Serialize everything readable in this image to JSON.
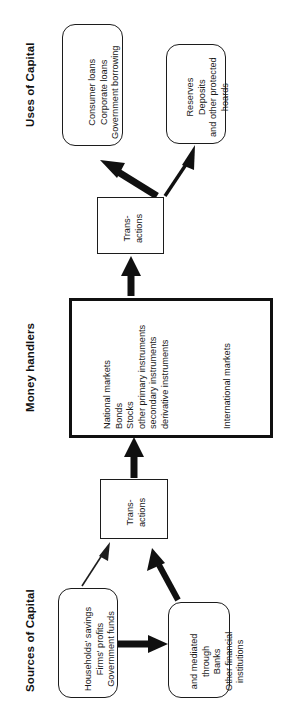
{
  "diagram": {
    "orientation": "rotated-90-ccw",
    "sections": [
      {
        "id": "uses",
        "label": "Uses of Capital"
      },
      {
        "id": "handlers",
        "label": "Money handlers"
      },
      {
        "id": "sources",
        "label": "Sources of Capital"
      }
    ],
    "nodes": {
      "uses_loans": {
        "shape": "rounded-rect",
        "lines": [
          "Consumer loans",
          "Corporate loans",
          "Government borrowing"
        ]
      },
      "uses_reserves": {
        "shape": "rounded-rect",
        "lines": [
          "Reserves",
          "Deposits",
          "and other protected",
          "hoards"
        ]
      },
      "transactions_top": {
        "shape": "rect",
        "lines": [
          "Trans-",
          "actions"
        ]
      },
      "markets": {
        "shape": "rect-heavy",
        "lines_primary": [
          "National markets",
          "Bonds",
          "Stocks",
          "other primary instruments",
          "secondary instruments",
          "derivative instruments"
        ],
        "lines_secondary": [
          "International markets"
        ]
      },
      "transactions_bottom": {
        "shape": "rect",
        "lines": [
          "Trans-",
          "actions"
        ]
      },
      "sources_savings": {
        "shape": "rounded-rect",
        "lines": [
          "Households' savings",
          "Firms' profits",
          "Government funds"
        ]
      },
      "sources_intermediaries": {
        "shape": "rounded-rect",
        "lines": [
          "and mediated",
          "through",
          "Banks",
          "Other financial",
          "institutions"
        ]
      }
    },
    "edges": [
      {
        "id": "savings-to-intermediaries",
        "from": "sources_savings",
        "to": "sources_intermediaries",
        "weight": "heavy"
      },
      {
        "id": "savings-to-transactions",
        "from": "sources_savings",
        "to": "transactions_bottom",
        "weight": "thin"
      },
      {
        "id": "intermediaries-to-transactions",
        "from": "sources_intermediaries",
        "to": "transactions_bottom",
        "weight": "heavy"
      },
      {
        "id": "transactions-to-markets",
        "from": "transactions_bottom",
        "to": "markets",
        "weight": "heavy"
      },
      {
        "id": "markets-to-transactions",
        "from": "markets",
        "to": "transactions_top",
        "weight": "heavy"
      },
      {
        "id": "transactions-to-loans",
        "from": "transactions_top",
        "to": "uses_loans",
        "weight": "heavy"
      },
      {
        "id": "transactions-to-reserves",
        "from": "transactions_top",
        "to": "uses_reserves",
        "weight": "medium"
      }
    ],
    "colors": {
      "ink": "#1a1a1a",
      "stroke": "#1c1c1c",
      "heavy_stroke": "#101010",
      "background": "#ffffff"
    }
  }
}
